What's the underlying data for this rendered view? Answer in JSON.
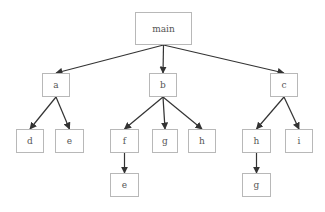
{
  "diagram": {
    "type": "call-tree",
    "colors": {
      "node_border": "#b8b8b8",
      "node_text": "#555555",
      "edge": "#333333",
      "background": "#ffffff"
    },
    "nodes": [
      {
        "id": "main",
        "label": "main",
        "x": 135,
        "y": 12,
        "w": 57,
        "h": 33
      },
      {
        "id": "a",
        "label": "a",
        "x": 42,
        "y": 73,
        "w": 28,
        "h": 24
      },
      {
        "id": "b",
        "label": "b",
        "x": 149,
        "y": 73,
        "w": 28,
        "h": 24
      },
      {
        "id": "c",
        "label": "c",
        "x": 270,
        "y": 73,
        "w": 28,
        "h": 24
      },
      {
        "id": "a_d",
        "label": "d",
        "x": 16,
        "y": 129,
        "w": 28,
        "h": 24
      },
      {
        "id": "a_e",
        "label": "e",
        "x": 55,
        "y": 129,
        "w": 29,
        "h": 24
      },
      {
        "id": "b_f",
        "label": "f",
        "x": 110,
        "y": 129,
        "w": 29,
        "h": 24
      },
      {
        "id": "b_g",
        "label": "g",
        "x": 152,
        "y": 129,
        "w": 26,
        "h": 24
      },
      {
        "id": "b_h",
        "label": "h",
        "x": 188,
        "y": 129,
        "w": 28,
        "h": 24
      },
      {
        "id": "f_e",
        "label": "e",
        "x": 110,
        "y": 173,
        "w": 29,
        "h": 24
      },
      {
        "id": "c_h",
        "label": "h",
        "x": 242,
        "y": 129,
        "w": 29,
        "h": 24
      },
      {
        "id": "c_i",
        "label": "i",
        "x": 285,
        "y": 129,
        "w": 28,
        "h": 24
      },
      {
        "id": "h_g",
        "label": "g",
        "x": 242,
        "y": 173,
        "w": 29,
        "h": 24
      }
    ],
    "edges": [
      {
        "from": "main",
        "to": "a"
      },
      {
        "from": "main",
        "to": "b"
      },
      {
        "from": "main",
        "to": "c"
      },
      {
        "from": "a",
        "to": "a_d"
      },
      {
        "from": "a",
        "to": "a_e"
      },
      {
        "from": "b",
        "to": "b_f"
      },
      {
        "from": "b",
        "to": "b_g"
      },
      {
        "from": "b",
        "to": "b_h"
      },
      {
        "from": "b_f",
        "to": "f_e"
      },
      {
        "from": "c",
        "to": "c_h"
      },
      {
        "from": "c",
        "to": "c_i"
      },
      {
        "from": "c_h",
        "to": "h_g"
      }
    ]
  }
}
